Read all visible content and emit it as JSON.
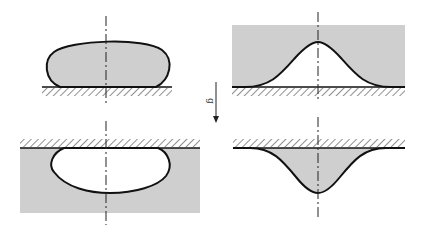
{
  "figure": {
    "type": "schematic",
    "gravity_label": "g",
    "colors": {
      "fill_grey": "#cfcfcf",
      "stroke": "#111111",
      "hatch": "#222222",
      "background": "#ffffff"
    },
    "panels": [
      {
        "id": "top-left",
        "name": "sessile-drop",
        "shape": "ellipse-on-substrate"
      },
      {
        "id": "top-right",
        "name": "bump-under-film",
        "shape": "bell-curve-cavity"
      },
      {
        "id": "bottom-left",
        "name": "pendant-bubble",
        "shape": "ellipse-under-ceiling"
      },
      {
        "id": "bottom-right",
        "name": "hanging-film-bulge",
        "shape": "inverted-bell-curve"
      }
    ]
  }
}
